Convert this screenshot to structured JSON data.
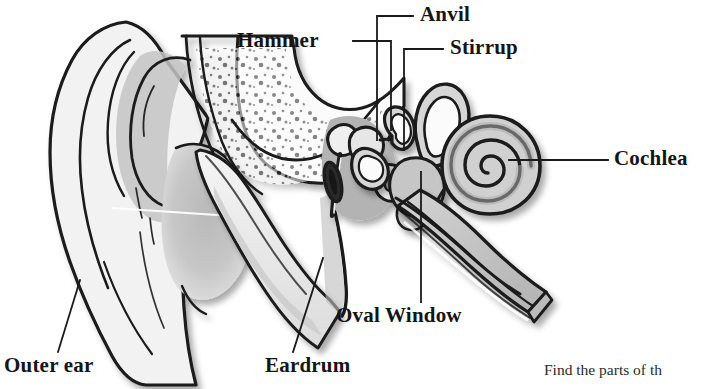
{
  "diagram": {
    "type": "anatomical-illustration",
    "background_color": "#ffffff",
    "line_color": "#1a1a1a",
    "shade_light": "#e8e8e8",
    "shade_mid": "#c9c9c9",
    "shade_dark": "#a9a9a9",
    "labels": [
      {
        "id": "hammer",
        "text": "Hammer",
        "x": 237,
        "y": 30,
        "style": "bold-serif"
      },
      {
        "id": "anvil",
        "text": "Anvil",
        "x": 420,
        "y": 4,
        "style": "bold-serif"
      },
      {
        "id": "stirrup",
        "text": "Stirrup",
        "x": 450,
        "y": 37,
        "style": "bold-serif"
      },
      {
        "id": "cochlea",
        "text": "Cochlea",
        "x": 614,
        "y": 148,
        "style": "bold-serif"
      },
      {
        "id": "oval-window",
        "text": "Oval Window",
        "x": 336,
        "y": 305,
        "style": "bold-serif"
      },
      {
        "id": "eardrum",
        "text": "Eardrum",
        "x": 265,
        "y": 355,
        "style": "bold-serif"
      },
      {
        "id": "outer-ear",
        "text": "Outer ear",
        "x": 4,
        "y": 355,
        "style": "bold-serif"
      }
    ],
    "caption": {
      "text": "Find the parts of th",
      "note": "text is clipped at the right edge of the image",
      "x": 544,
      "y": 362
    }
  }
}
